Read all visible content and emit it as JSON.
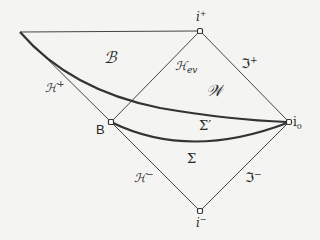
{
  "diagram": {
    "type": "penrose-diagram",
    "colors": {
      "line": "#333333",
      "background": "#f4f4f2",
      "text": "#2a2a2a"
    },
    "points": {
      "corner": {
        "x": 20,
        "y": 32
      },
      "i_plus": {
        "x": 200,
        "y": 31,
        "label": "i",
        "sup": "+"
      },
      "i_zero": {
        "x": 289,
        "y": 122,
        "label": "i",
        "sub": "0"
      },
      "i_minus": {
        "x": 200,
        "y": 211,
        "label": "i",
        "sup": "−"
      },
      "B": {
        "x": 111,
        "y": 122,
        "label": "B"
      }
    },
    "labels": {
      "region_B": "ℬ",
      "region_W": "𝒲",
      "H_plus": "ℋ",
      "H_plus_sup": "+",
      "H_ev": "ℋ",
      "H_ev_sub": "ev",
      "scri_plus": "ℑ",
      "scri_plus_sup": "+",
      "scri_minus": "ℑ",
      "scri_minus_sup": "−",
      "H_minus": "ℋ",
      "H_minus_sup": "−",
      "sigma_prime": "Σ′",
      "sigma": "Σ"
    }
  }
}
